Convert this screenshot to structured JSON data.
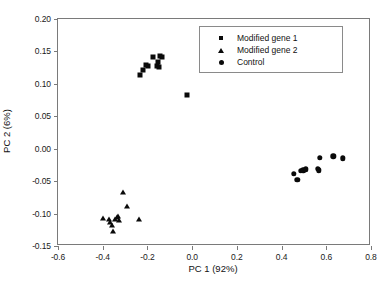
{
  "chart_data": {
    "type": "scatter",
    "title": "",
    "xlabel": "PC 1 (92%)",
    "ylabel": "PC 2 (6%)",
    "xlim": [
      -0.6,
      0.8
    ],
    "ylim": [
      -0.15,
      0.2
    ],
    "xticks": [
      "-0.6",
      "-0.4",
      "-0.2",
      "0.0",
      "0.2",
      "0.4",
      "0.6",
      "0.8"
    ],
    "xtick_values": [
      -0.6,
      -0.4,
      -0.2,
      0.0,
      0.2,
      0.4,
      0.6,
      0.8
    ],
    "yticks": [
      "0.20",
      "0.15",
      "0.10",
      "0.05",
      "0.00",
      "-0.05",
      "-0.10",
      "-0.15"
    ],
    "ytick_values": [
      0.2,
      0.15,
      0.1,
      0.05,
      0.0,
      -0.05,
      -0.1,
      -0.15
    ],
    "grid": false,
    "legend_position": "top-right",
    "marker_color": "#0a0a0a",
    "frame_color": "#7a7a7a",
    "series": [
      {
        "name": "Modified gene 1",
        "marker": "square",
        "points": [
          [
            -0.235,
            0.113
          ],
          [
            -0.222,
            0.122
          ],
          [
            -0.205,
            0.129
          ],
          [
            -0.198,
            0.127
          ],
          [
            -0.177,
            0.141
          ],
          [
            -0.158,
            0.127
          ],
          [
            -0.152,
            0.134
          ],
          [
            -0.142,
            0.143
          ],
          [
            -0.136,
            0.142
          ],
          [
            -0.147,
            0.126
          ],
          [
            -0.023,
            0.083
          ]
        ]
      },
      {
        "name": "Modified gene 2",
        "marker": "triangle",
        "points": [
          [
            -0.399,
            -0.107
          ],
          [
            -0.372,
            -0.108
          ],
          [
            -0.366,
            -0.113
          ],
          [
            -0.358,
            -0.117
          ],
          [
            -0.352,
            -0.127
          ],
          [
            -0.344,
            -0.109
          ],
          [
            -0.338,
            -0.106
          ],
          [
            -0.33,
            -0.103
          ],
          [
            -0.325,
            -0.11
          ],
          [
            -0.31,
            -0.066
          ],
          [
            -0.292,
            -0.089
          ],
          [
            -0.236,
            -0.108
          ]
        ]
      },
      {
        "name": "Control",
        "marker": "circle",
        "points": [
          [
            0.455,
            -0.039
          ],
          [
            0.47,
            -0.048
          ],
          [
            0.487,
            -0.034
          ],
          [
            0.498,
            -0.033
          ],
          [
            0.508,
            -0.032
          ],
          [
            0.562,
            -0.031
          ],
          [
            0.566,
            -0.033
          ],
          [
            0.57,
            -0.014
          ],
          [
            0.632,
            -0.012
          ],
          [
            0.675,
            -0.015
          ]
        ]
      }
    ]
  },
  "legend": {
    "entries": [
      {
        "label": "Modified gene 1",
        "marker": "square"
      },
      {
        "label": "Modified gene 2",
        "marker": "triangle"
      },
      {
        "label": "Control",
        "marker": "circle"
      }
    ]
  }
}
